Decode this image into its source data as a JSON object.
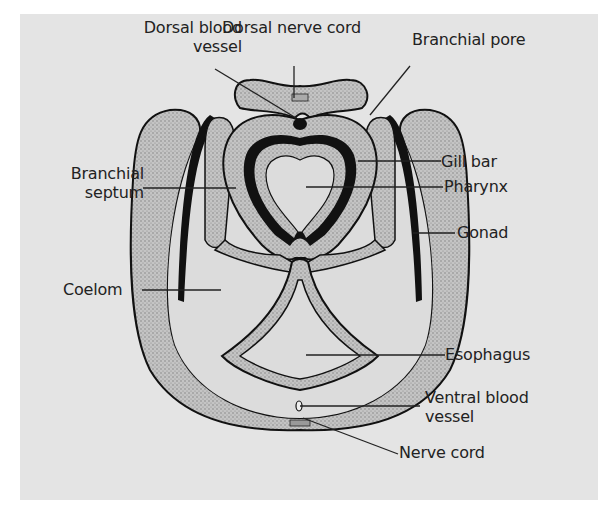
{
  "figure": {
    "background_color": "#e4e4e4",
    "tissue_fill": "#b9b9b9",
    "outline_color": "#111111",
    "labels": [
      {
        "id": "dorsal_blood_vessel",
        "line1": "Dorsal blood",
        "line2": "vessel"
      },
      {
        "id": "dorsal_nerve_cord",
        "line1": "Dorsal nerve cord"
      },
      {
        "id": "branchial_pore",
        "line1": "Branchial pore"
      },
      {
        "id": "gill_bar",
        "line1": "Gill bar"
      },
      {
        "id": "branchial_septum",
        "line1": "Branchial",
        "line2": "septum"
      },
      {
        "id": "pharynx",
        "line1": "Pharynx"
      },
      {
        "id": "gonad",
        "line1": "Gonad"
      },
      {
        "id": "coelom",
        "line1": "Coelom"
      },
      {
        "id": "esophagus",
        "line1": "Esophagus"
      },
      {
        "id": "ventral_blood_vessel",
        "line1": "Ventral blood",
        "line2": "vessel"
      },
      {
        "id": "nerve_cord",
        "line1": "Nerve cord"
      }
    ]
  }
}
